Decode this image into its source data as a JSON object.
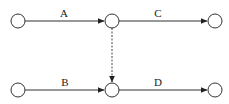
{
  "diagram": {
    "type": "activity-on-arrow network",
    "nodes": [
      {
        "id": "n1",
        "x": 18,
        "y": 21
      },
      {
        "id": "n2",
        "x": 112,
        "y": 21
      },
      {
        "id": "n3",
        "x": 215,
        "y": 21
      },
      {
        "id": "n4",
        "x": 18,
        "y": 90
      },
      {
        "id": "n5",
        "x": 112,
        "y": 90
      },
      {
        "id": "n6",
        "x": 215,
        "y": 90
      }
    ],
    "edges": [
      {
        "from": "n1",
        "to": "n2",
        "label": "A",
        "style": "solid"
      },
      {
        "from": "n2",
        "to": "n3",
        "label": "C",
        "style": "solid"
      },
      {
        "from": "n4",
        "to": "n5",
        "label": "B",
        "style": "solid"
      },
      {
        "from": "n5",
        "to": "n6",
        "label": "D",
        "style": "solid"
      },
      {
        "from": "n2",
        "to": "n5",
        "label": "",
        "style": "dashed"
      }
    ],
    "labels": {
      "a": "A",
      "b": "B",
      "c": "C",
      "d": "D"
    }
  }
}
